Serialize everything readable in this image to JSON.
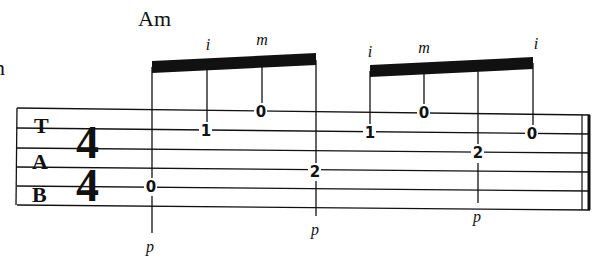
{
  "chord": {
    "name": "Am"
  },
  "clipped_text": "n",
  "staff": {
    "label": [
      "T",
      "A",
      "B"
    ],
    "time_signature": {
      "top": "4",
      "bottom": "4"
    },
    "strings": 6,
    "color": "#111111"
  },
  "groups": [
    {
      "beam": "eighth-group-1",
      "notes": [
        {
          "fret": "0",
          "string": 5,
          "finger": "p",
          "stem": "down"
        },
        {
          "fret": "1",
          "string": 2,
          "finger": "i",
          "stem": "up"
        },
        {
          "fret": "0",
          "string": 1,
          "finger": "m",
          "stem": "up"
        },
        {
          "fret": "2",
          "string": 4,
          "finger": "p",
          "stem": "down"
        }
      ]
    },
    {
      "beam": "eighth-group-2",
      "notes": [
        {
          "fret": "1",
          "string": 2,
          "finger": "i",
          "stem": "up"
        },
        {
          "fret": "0",
          "string": 1,
          "finger": "m",
          "stem": "up"
        },
        {
          "fret": "2",
          "string": 3,
          "finger": "p",
          "stem": "down"
        },
        {
          "fret": "0",
          "string": 2,
          "finger": "i",
          "stem": "up"
        }
      ]
    }
  ],
  "end_barline": "final-double-bar"
}
